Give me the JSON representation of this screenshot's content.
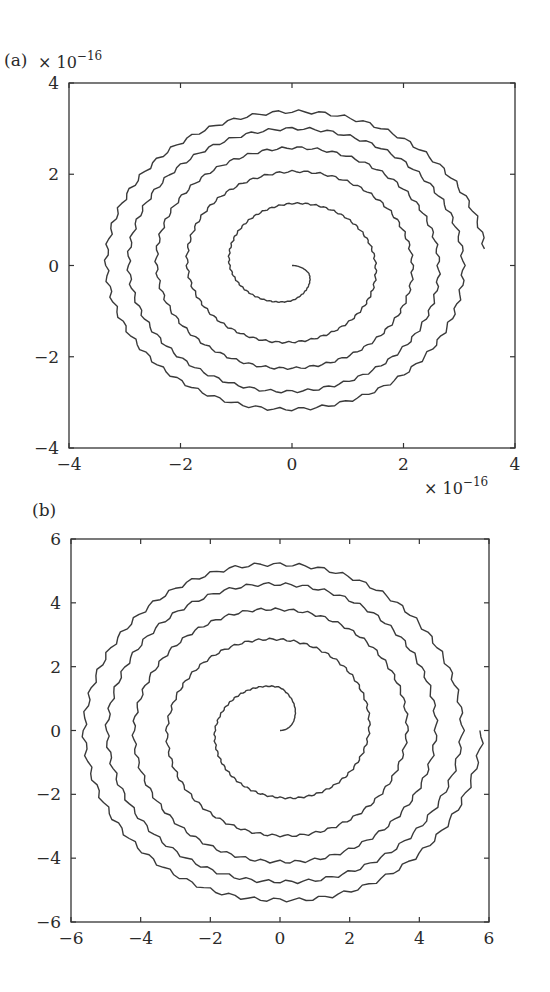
{
  "chart_data": [
    {
      "type": "line",
      "panel_label": "(a)",
      "title": "",
      "xlabel": "",
      "ylabel": "",
      "x_scale_note": "× 10^−16",
      "y_scale_note": "× 10^−16",
      "xlim": [
        -4,
        4
      ],
      "ylim": [
        -4,
        4
      ],
      "xticks": [
        -4,
        -2,
        0,
        2,
        4
      ],
      "yticks": [
        -4,
        -2,
        0,
        2,
        4
      ],
      "xtick_labels": [
        "−4",
        "−2",
        "0",
        "2",
        "4"
      ],
      "ytick_labels": [
        "−4",
        "−2",
        "0",
        "2",
        "4"
      ],
      "grid": false,
      "legend": null,
      "series": [
        {
          "name": "spiral trajectory (clockwise outward)",
          "description": "Outward spiral starting at origin; radius sampled every quarter-turn (angle in degrees, clockwise from +x)",
          "angle_deg": [
            0,
            30,
            90,
            180,
            270,
            360,
            450,
            540,
            630,
            720,
            810,
            900,
            990,
            1080,
            1170,
            1260,
            1350,
            1440,
            1530,
            1620,
            1710,
            1795
          ],
          "radius": [
            0,
            0.35,
            0.77,
            1.12,
            1.36,
            1.5,
            1.68,
            1.88,
            2.06,
            2.16,
            2.25,
            2.43,
            2.58,
            2.63,
            2.76,
            2.93,
            3.0,
            3.07,
            3.15,
            3.33,
            3.37,
            3.48
          ],
          "direction": "cw"
        }
      ]
    },
    {
      "type": "line",
      "panel_label": "(b)",
      "title": "",
      "xlabel": "",
      "ylabel": "",
      "xlim": [
        -6,
        6
      ],
      "ylim": [
        -6,
        6
      ],
      "xticks": [
        -6,
        -4,
        -2,
        0,
        2,
        4,
        6
      ],
      "yticks": [
        -6,
        -4,
        -2,
        0,
        2,
        4,
        6
      ],
      "xtick_labels": [
        "−6",
        "−4",
        "−2",
        "0",
        "2",
        "4",
        "6"
      ],
      "ytick_labels": [
        "−6",
        "−4",
        "−2",
        "0",
        "2",
        "4",
        "6"
      ],
      "grid": false,
      "legend": null,
      "series": [
        {
          "name": "spiral trajectory (counter-clockwise outward)",
          "description": "Outward spiral starting at origin; radius sampled every quarter-turn (angle in degrees, counter-clockwise from +x)",
          "angle_deg": [
            0,
            45,
            90,
            180,
            270,
            360,
            450,
            540,
            630,
            720,
            810,
            900,
            990,
            1080,
            1170,
            1260,
            1350,
            1440,
            1530,
            1620,
            1710,
            1800
          ],
          "radius": [
            0,
            0.6,
            1.35,
            1.87,
            2.1,
            2.56,
            2.85,
            3.25,
            3.29,
            3.65,
            3.79,
            4.2,
            4.11,
            4.48,
            4.58,
            4.97,
            4.73,
            5.23,
            5.2,
            5.63,
            5.3,
            5.8
          ],
          "direction": "ccw"
        }
      ]
    }
  ],
  "panels": [
    {
      "label": "(a)",
      "exponent_top": "× 10",
      "exponent_top_sup": "−16",
      "exponent_bottom": "× 10",
      "exponent_bottom_sup": "−16",
      "frame": {
        "left": 69,
        "top": 83,
        "right": 515,
        "bottom": 448
      }
    },
    {
      "label": "(b)",
      "frame": {
        "left": 71,
        "top": 539,
        "right": 489,
        "bottom": 922
      }
    }
  ]
}
